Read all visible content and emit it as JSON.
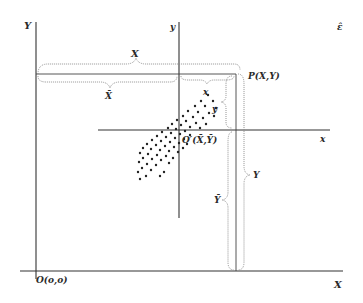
{
  "diagram": {
    "title": "",
    "labels": {
      "main_y_axis": "Y",
      "main_x_axis": "X",
      "origin": "O(o,o)",
      "sub_y_axis": "y",
      "sub_x_axis": "x",
      "sub_origin": "O′(X̄,Ȳ)",
      "point": "P(X,Y)",
      "brace_X": "X",
      "brace_Xbar": "X̄",
      "brace_x": "x",
      "brace_y": "y",
      "brace_Y": "Y",
      "brace_Ybar": "Ȳ",
      "corner_mark": "ε̂"
    },
    "colors": {
      "ink": "#2a2a2a",
      "brace": "#888888",
      "background": "#ffffff"
    },
    "scatter_points": [
      [
        208,
        95
      ],
      [
        201,
        101
      ],
      [
        213,
        101
      ],
      [
        195,
        106
      ],
      [
        205,
        106
      ],
      [
        216,
        108
      ],
      [
        188,
        111
      ],
      [
        198,
        112
      ],
      [
        209,
        113
      ],
      [
        183,
        116
      ],
      [
        193,
        117
      ],
      [
        203,
        118
      ],
      [
        214,
        116
      ],
      [
        177,
        120
      ],
      [
        186,
        121
      ],
      [
        196,
        123
      ],
      [
        206,
        124
      ],
      [
        172,
        124
      ],
      [
        181,
        125
      ],
      [
        190,
        127
      ],
      [
        200,
        128
      ],
      [
        168,
        128
      ],
      [
        176,
        129
      ],
      [
        185,
        131
      ],
      [
        162,
        132
      ],
      [
        171,
        133
      ],
      [
        180,
        134
      ],
      [
        190,
        135
      ],
      [
        157,
        136
      ],
      [
        166,
        137
      ],
      [
        175,
        138
      ],
      [
        184,
        139
      ],
      [
        152,
        140
      ],
      [
        161,
        141
      ],
      [
        170,
        142
      ],
      [
        179,
        143
      ],
      [
        147,
        144
      ],
      [
        156,
        145
      ],
      [
        165,
        146
      ],
      [
        174,
        147
      ],
      [
        143,
        148
      ],
      [
        151,
        149
      ],
      [
        160,
        150
      ],
      [
        169,
        151
      ],
      [
        140,
        153
      ],
      [
        148,
        154
      ],
      [
        157,
        155
      ],
      [
        166,
        156
      ],
      [
        143,
        158
      ],
      [
        152,
        159
      ],
      [
        161,
        160
      ],
      [
        139,
        162
      ],
      [
        147,
        164
      ],
      [
        156,
        165
      ],
      [
        142,
        168
      ],
      [
        151,
        170
      ],
      [
        138,
        172
      ],
      [
        146,
        176
      ],
      [
        140,
        179
      ],
      [
        160,
        176
      ],
      [
        164,
        172
      ],
      [
        169,
        163
      ],
      [
        173,
        158
      ],
      [
        178,
        152
      ],
      [
        183,
        148
      ],
      [
        187,
        144
      ]
    ]
  }
}
